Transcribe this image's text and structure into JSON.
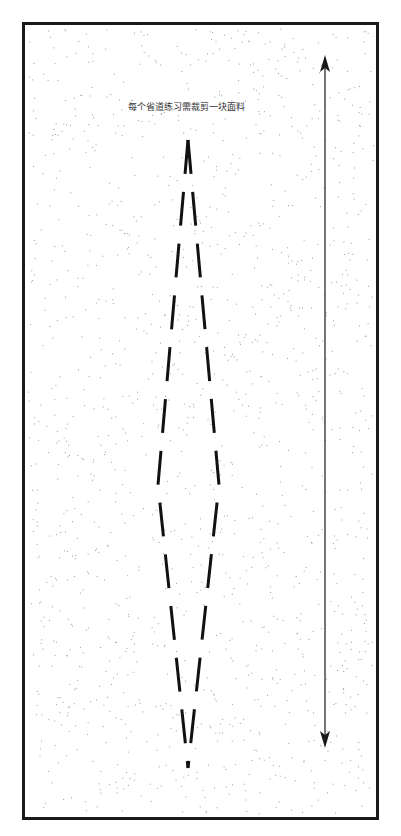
{
  "diagram": {
    "caption": "每个省道练习需裁剪一块面料",
    "frame": {
      "x": 22,
      "y": 22,
      "width": 354,
      "height": 795,
      "stroke": "#1a1a1a"
    },
    "grain_arrow": {
      "x": 325,
      "y_top": 55,
      "y_bottom": 748,
      "color": "#1a1a1a"
    },
    "dart": {
      "top": [
        188,
        140
      ],
      "left": [
        158,
        485
      ],
      "right": [
        219,
        485
      ],
      "bottom": [
        188,
        768
      ],
      "dash": "34 18",
      "color": "#111111"
    },
    "speckle_color": "#9a9a9a"
  }
}
